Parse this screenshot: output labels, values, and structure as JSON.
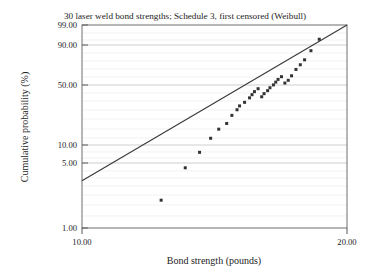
{
  "chart_data": {
    "type": "scatter",
    "title": "30 laser weld bond strengths; Schedule 3, first censored (Weibull)",
    "xlabel": "Bond strength (pounds)",
    "ylabel": "Cumulative probability (%)",
    "xscale": "log",
    "yscale": "weibull-probability",
    "xlim": [
      10.0,
      20.0
    ],
    "ylim": [
      1.0,
      99.0
    ],
    "grid": true,
    "legend": "none",
    "xticks": [
      "10.00",
      "20.00"
    ],
    "xtick_values": [
      10.0,
      20.0
    ],
    "yticks": [
      "99.00",
      "90.00",
      "50.00",
      "10.00",
      "5.00",
      "1.00"
    ],
    "ytick_values": [
      99.0,
      90.0,
      50.0,
      10.0,
      5.0,
      1.0
    ],
    "series": [
      {
        "name": "Bond strength observations",
        "marker": "square",
        "color": "#333333",
        "x": [
          12.3,
          13.1,
          13.6,
          14.0,
          14.3,
          14.6,
          14.8,
          15.0,
          15.1,
          15.3,
          15.5,
          15.6,
          15.7,
          15.85,
          16.0,
          16.1,
          16.25,
          16.35,
          16.5,
          16.6,
          16.7,
          16.85,
          17.0,
          17.15,
          17.3,
          17.5,
          17.7,
          17.9,
          18.2,
          18.6
        ],
        "y": [
          2.3,
          6.0,
          9.4,
          14.0,
          18.0,
          21.0,
          26.0,
          30.0,
          33.0,
          36.0,
          40.0,
          43.0,
          46.0,
          49.0,
          41.0,
          44.0,
          47.0,
          50.0,
          53.0,
          56.0,
          59.0,
          62.0,
          55.0,
          58.0,
          63.0,
          70.0,
          75.0,
          80.0,
          88.0,
          95.0
        ]
      }
    ],
    "fit_line": {
      "name": "Weibull maximum likelihood fit",
      "x": [
        10.0,
        20.0
      ],
      "y": [
        4.1,
        99.0
      ],
      "color": "#3a3a3a"
    }
  },
  "axes": {
    "y_title": "Cumulative probability (%)",
    "x_title": "Bond strength (pounds)"
  }
}
